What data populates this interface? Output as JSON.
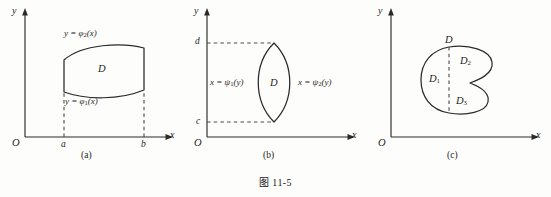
{
  "figure": {
    "caption": "图 11-5",
    "background_color": "#fdfdfb",
    "ink_color": "#2b2b2b"
  },
  "panels": [
    {
      "id": "a",
      "caption": "(a)",
      "axes": {
        "y_label": "y",
        "x_label": "x",
        "origin_label": "O"
      },
      "ticks": {
        "x_left": "a",
        "x_right": "b"
      },
      "labels": {
        "upper_curve_prefix": "y = φ",
        "upper_curve_sub": "2",
        "upper_curve_suffix": "(x)",
        "lower_curve_prefix": "y = φ",
        "lower_curve_sub": "1",
        "lower_curve_suffix": "(x)",
        "region": "D"
      }
    },
    {
      "id": "b",
      "caption": "(b)",
      "axes": {
        "y_label": "y",
        "x_label": "x",
        "origin_label": "O"
      },
      "ticks": {
        "y_lower": "c",
        "y_upper": "d"
      },
      "labels": {
        "left_curve_prefix": "x = ψ",
        "left_curve_sub": "1",
        "left_curve_suffix": "(y)",
        "right_curve_prefix": "x = ψ",
        "right_curve_sub": "2",
        "right_curve_suffix": "(y)",
        "region": "D"
      }
    },
    {
      "id": "c",
      "caption": "(c)",
      "axes": {
        "y_label": "y",
        "x_label": "x",
        "origin_label": "O"
      },
      "labels": {
        "region": "D",
        "sub_region_1_prefix": "D",
        "sub_region_1_sub": "1",
        "sub_region_2_prefix": "D",
        "sub_region_2_sub": "2",
        "sub_region_3_prefix": "D",
        "sub_region_3_sub": "3"
      }
    }
  ]
}
